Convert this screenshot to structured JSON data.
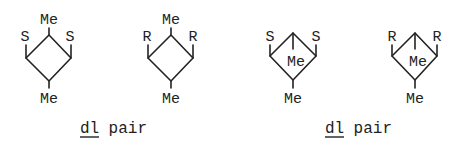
{
  "structures": [
    {
      "id": "s1",
      "top": "Me",
      "left": "S",
      "right": "S",
      "bottom": "Me",
      "center": ""
    },
    {
      "id": "s2",
      "top": "Me",
      "left": "R",
      "right": "R",
      "bottom": "Me",
      "center": ""
    },
    {
      "id": "s3",
      "top": "",
      "left": "S",
      "right": "S",
      "bottom": "Me",
      "center": "Me"
    },
    {
      "id": "s4",
      "top": "",
      "left": "R",
      "right": "R",
      "bottom": "Me",
      "center": "Me"
    }
  ],
  "captions": [
    {
      "prefix": "dl",
      "suffix": " pair"
    },
    {
      "prefix": "dl",
      "suffix": " pair"
    }
  ]
}
